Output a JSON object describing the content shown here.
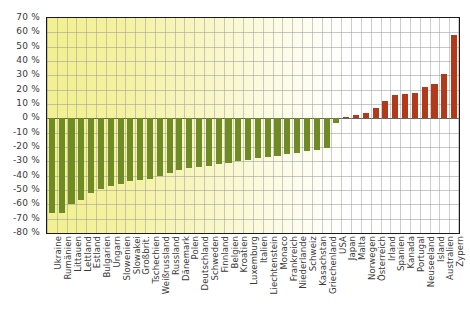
{
  "chart_data": {
    "type": "bar",
    "title": "",
    "subtitle": "",
    "xlabel": "",
    "ylabel": "",
    "ylim": [
      -80,
      70
    ],
    "ytick_step": 10,
    "ytick_labels": [
      "70 %",
      "60 %",
      "50 %",
      "40 %",
      "30 %",
      "20 %",
      "10 %",
      "0 %",
      "-10 %",
      "-20 %",
      "-30 %",
      "-40 %",
      "-50 %",
      "-60 %",
      "-70 %",
      "-80 %"
    ],
    "ytick_values": [
      70,
      60,
      50,
      40,
      30,
      20,
      10,
      0,
      -10,
      -20,
      -30,
      -40,
      -50,
      -60,
      -70,
      -80
    ],
    "grid": true,
    "legend": "none",
    "value_unit": "%",
    "colors": {
      "negative": "#6f8b26",
      "positive": "#b23a1a",
      "axis": "#1a1a1a",
      "grid": "#9a9a9a"
    },
    "background_gradient": [
      "#f2f08f",
      "#ffffff"
    ],
    "categories": [
      "Ukraine",
      "Rumänien",
      "Littauen",
      "Lettland",
      "Estland",
      "Bulgarien",
      "Ungarn",
      "Slowenien",
      "Slowakei",
      "Großbrit.",
      "Tschechien",
      "Weißrussland",
      "Russland",
      "Dänemark",
      "Polen",
      "Deutschland",
      "Schweden",
      "Finnland",
      "Belgien",
      "Kroatien",
      "Luxemburg",
      "Italien",
      "Liechtenstein",
      "Monaco",
      "Frankreich",
      "Niederlande",
      "Schweiz",
      "Kasachstan",
      "Griechenland",
      "USA",
      "Japan",
      "Malta",
      "Norwegen",
      "Österreich",
      "Irland",
      "Spanien",
      "Kanada",
      "Portugal",
      "Neuseeland",
      "Island",
      "Australien",
      "Zypern"
    ],
    "values": [
      -66,
      -66,
      -60,
      -57,
      -52,
      -49,
      -47,
      -46,
      -44,
      -43,
      -42,
      -40,
      -38,
      -36,
      -35,
      -34,
      -33,
      -32,
      -31,
      -30,
      -29,
      -28,
      -27,
      -26,
      -25,
      -24,
      -23,
      -22,
      -21,
      -3,
      1,
      2,
      4,
      7,
      12,
      16,
      17,
      18,
      22,
      24,
      31,
      58
    ]
  }
}
